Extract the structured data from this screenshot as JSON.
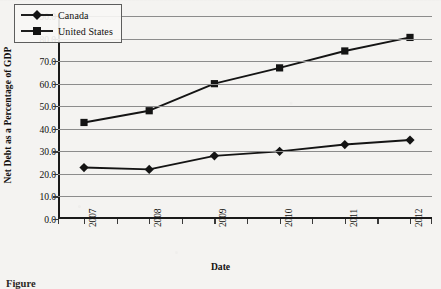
{
  "chart_data": {
    "type": "line",
    "title": "",
    "xlabel": "Date",
    "ylabel": "Net Debt as a Percentage of GDP",
    "categories": [
      "2007",
      "2008",
      "2009",
      "2010",
      "2011",
      "2012"
    ],
    "series": [
      {
        "name": "Canada",
        "marker": "diamond",
        "values": [
          22.8,
          22.0,
          28.0,
          30.0,
          33.0,
          35.0
        ]
      },
      {
        "name": "United States",
        "marker": "square",
        "values": [
          42.8,
          48.0,
          60.0,
          67.0,
          74.5,
          80.5
        ]
      }
    ],
    "ylim": [
      0.0,
      90.0
    ],
    "ytick_step": 10.0,
    "yticks": [
      "0.0",
      "10.0",
      "20.0",
      "30.0",
      "40.0",
      "50.0",
      "60.0",
      "70.0",
      "80.0",
      "90.0"
    ],
    "grid": "horizontal",
    "legend_position": "top-left-inside",
    "line_color": "#141414",
    "grid_color": "#8c8c8c",
    "axis_color": "#1a1a1a",
    "background_color": "#f4f3f1"
  },
  "legend": {
    "entries": [
      {
        "label": "Canada",
        "marker": "diamond"
      },
      {
        "label": "United States",
        "marker": "square"
      }
    ]
  },
  "caption": {
    "text": "Figure"
  }
}
